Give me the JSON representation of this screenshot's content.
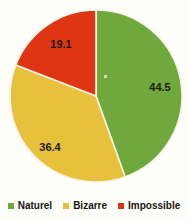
{
  "chart_data": {
    "type": "pie",
    "title": "",
    "subtitle": "",
    "xlabel": "",
    "ylabel": "",
    "grid": false,
    "legend_position": "bottom",
    "start_angle_deg": 0,
    "direction": "clockwise",
    "units": "percent",
    "total": 100.0,
    "categories": [
      "Naturel",
      "Bizarre",
      "Impossible"
    ],
    "values": [
      44.5,
      36.4,
      19.1
    ],
    "colors": [
      "#6fa83c",
      "#e8c13c",
      "#df3512"
    ],
    "slices": [
      {
        "label": "Naturel",
        "value": 44.5,
        "value_text": "44.5",
        "color": "#6fa83c",
        "start_deg": 0.0,
        "end_deg": 160.2,
        "label_x": 160,
        "label_y": 88
      },
      {
        "label": "Bizarre",
        "value": 36.4,
        "value_text": "36.4",
        "color": "#e8c13c",
        "start_deg": 160.2,
        "end_deg": 291.2,
        "label_x": 50,
        "label_y": 148
      },
      {
        "label": "Impossible",
        "value": 19.1,
        "value_text": "19.1",
        "color": "#df3512",
        "start_deg": 291.2,
        "end_deg": 360.0,
        "label_x": 61,
        "label_y": 45
      }
    ],
    "geometry": {
      "center_x": 96,
      "center_y": 96,
      "radius": 86,
      "separator_color": "#f7f4e6",
      "separator_width": 1.6
    },
    "legend": [
      {
        "label": "Naturel",
        "color": "#6fa83c"
      },
      {
        "label": "Bizarre",
        "color": "#e8c13c"
      },
      {
        "label": "Impossible",
        "color": "#df3512"
      }
    ],
    "background_color": "#fdfdfa"
  }
}
